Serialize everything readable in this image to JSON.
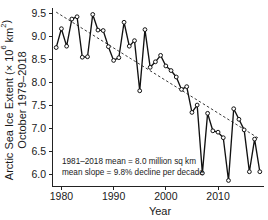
{
  "chart_data": {
    "type": "line",
    "title": "",
    "subtitle": "",
    "xlabel": "Year",
    "ylabel_line1": "Arctic Sea Ice Extent (× 10⁶ km²)",
    "ylabel_line2": "October 1979–2018",
    "xlim": [
      1978.2,
      2018.8
    ],
    "ylim": [
      5.75,
      9.62
    ],
    "xticks": [
      1980,
      1990,
      2000,
      2010
    ],
    "xtick_labels": [
      "1980",
      "1990",
      "2000",
      "2010"
    ],
    "yticks": [
      6.0,
      6.5,
      7.0,
      7.5,
      8.0,
      8.5,
      9.0,
      9.5
    ],
    "ytick_labels": [
      "6.0",
      "6.5",
      "7.0",
      "7.5",
      "8.0",
      "8.5",
      "9.0",
      "9.5"
    ],
    "grid": false,
    "legend": "none",
    "marker": "open-circle",
    "line_color": "#111111",
    "trend_color": "#3a3a3a",
    "trend_style": "dashed",
    "x": [
      1979,
      1980,
      1981,
      1982,
      1983,
      1984,
      1985,
      1986,
      1987,
      1988,
      1989,
      1990,
      1991,
      1992,
      1993,
      1994,
      1995,
      1996,
      1997,
      1998,
      1999,
      2000,
      2001,
      2002,
      2003,
      2004,
      2005,
      2006,
      2007,
      2008,
      2009,
      2010,
      2011,
      2012,
      2013,
      2014,
      2015,
      2016,
      2017,
      2018
    ],
    "values": [
      8.76,
      9.17,
      8.79,
      9.38,
      9.43,
      8.55,
      8.56,
      9.48,
      9.14,
      9.13,
      8.78,
      8.48,
      8.54,
      9.31,
      8.79,
      8.91,
      7.82,
      9.15,
      8.33,
      8.45,
      8.59,
      8.36,
      8.26,
      8.12,
      7.85,
      7.91,
      7.35,
      7.51,
      6.03,
      7.33,
      6.95,
      6.92,
      6.8,
      5.87,
      7.43,
      7.2,
      6.97,
      6.06,
      6.77,
      6.06
    ],
    "series": [
      {
        "name": "Arctic sea ice extent (October mean)",
        "values": [
          8.76,
          9.17,
          8.79,
          9.38,
          9.43,
          8.55,
          8.56,
          9.48,
          9.14,
          9.13,
          8.78,
          8.48,
          8.54,
          9.31,
          8.79,
          8.91,
          7.82,
          9.15,
          8.33,
          8.45,
          8.59,
          8.36,
          8.26,
          8.12,
          7.85,
          7.91,
          7.35,
          7.51,
          6.03,
          7.33,
          6.95,
          6.92,
          6.8,
          5.87,
          7.43,
          7.2,
          6.97,
          6.06,
          6.77,
          6.06
        ]
      }
    ],
    "trend": {
      "name": "linear trend",
      "x": [
        1979,
        2018
      ],
      "y": [
        9.53,
        6.77
      ]
    },
    "annotations": [
      "1981–2018 mean = 8.0 million sq km",
      "mean slope = 9.8% decline per decade"
    ]
  }
}
